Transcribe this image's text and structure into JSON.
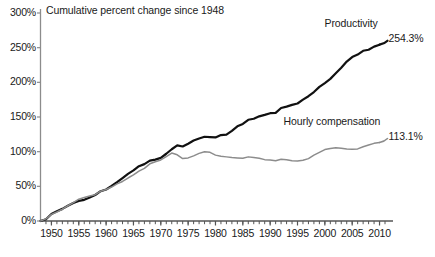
{
  "chart_data": {
    "type": "line",
    "title": "Cumulative percent change since 1948",
    "xlabel": "",
    "ylabel": "",
    "ylim": [
      0,
      300
    ],
    "xlim": [
      1948,
      2011
    ],
    "grid": false,
    "legend_position": "inline-right",
    "y_ticks": [
      "0%",
      "50%",
      "100%",
      "150%",
      "200%",
      "250%",
      "300%"
    ],
    "y_tick_values": [
      0,
      50,
      100,
      150,
      200,
      250,
      300
    ],
    "x_ticks": [
      "1950",
      "1955",
      "1960",
      "1965",
      "1970",
      "1975",
      "1980",
      "1985",
      "1990",
      "1995",
      "2000",
      "2005",
      "2010"
    ],
    "x_tick_values": [
      1950,
      1955,
      1960,
      1965,
      1970,
      1975,
      1980,
      1985,
      1990,
      1995,
      2000,
      2005,
      2010
    ],
    "x_minor_step": 1,
    "series": [
      {
        "name": "Productivity",
        "end_label": "254.3%",
        "color": "#111111",
        "width": 2.2,
        "x": [
          1948,
          1949,
          1950,
          1951,
          1952,
          1953,
          1954,
          1955,
          1956,
          1957,
          1958,
          1959,
          1960,
          1961,
          1962,
          1963,
          1964,
          1965,
          1966,
          1967,
          1968,
          1969,
          1970,
          1971,
          1972,
          1973,
          1974,
          1975,
          1976,
          1977,
          1978,
          1979,
          1980,
          1981,
          1982,
          1983,
          1984,
          1985,
          1986,
          1987,
          1988,
          1989,
          1990,
          1991,
          1992,
          1993,
          1994,
          1995,
          1996,
          1997,
          1998,
          1999,
          2000,
          2001,
          2002,
          2003,
          2004,
          2005,
          2006,
          2007,
          2008,
          2009,
          2010
        ],
        "values": [
          0,
          2.5,
          10,
          14,
          17.5,
          22,
          26,
          29,
          30.5,
          34,
          37.5,
          43,
          45.5,
          50.5,
          56,
          62,
          68,
          73,
          79,
          82,
          87,
          88.5,
          91,
          97,
          103.5,
          109,
          107.5,
          111.5,
          116,
          119,
          121.5,
          121,
          120.5,
          124,
          124.5,
          130,
          136.5,
          140,
          146,
          147.5,
          151,
          153,
          155.5,
          156,
          163,
          165,
          167.5,
          169.5,
          175,
          180,
          186,
          193.5,
          199,
          205,
          213,
          221,
          230,
          236.5,
          240,
          245.5,
          247,
          251.5,
          254.3
        ]
      },
      {
        "name": "Hourly compensation",
        "end_label": "113.1%",
        "color": "#8c8c8c",
        "width": 1.5,
        "x": [
          1948,
          1949,
          1950,
          1951,
          1952,
          1953,
          1954,
          1955,
          1956,
          1957,
          1958,
          1959,
          1960,
          1961,
          1962,
          1963,
          1964,
          1965,
          1966,
          1967,
          1968,
          1969,
          1970,
          1971,
          1972,
          1973,
          1974,
          1975,
          1976,
          1977,
          1978,
          1979,
          1980,
          1981,
          1982,
          1983,
          1984,
          1985,
          1986,
          1987,
          1988,
          1989,
          1990,
          1991,
          1992,
          1993,
          1994,
          1995,
          1996,
          1997,
          1998,
          1999,
          2000,
          2001,
          2002,
          2003,
          2004,
          2005,
          2006,
          2007,
          2008,
          2009,
          2010
        ],
        "values": [
          0,
          3,
          9.5,
          13,
          17,
          22,
          26.5,
          31.5,
          34,
          36,
          38,
          43,
          45.5,
          49,
          53.5,
          57,
          62,
          66.5,
          72,
          76,
          82.5,
          85.5,
          88,
          93,
          98,
          95.5,
          90,
          91,
          94,
          97.5,
          100,
          99,
          95,
          93.5,
          92.5,
          91.5,
          91,
          90.5,
          92.5,
          91.5,
          90.5,
          88.5,
          88,
          87,
          89,
          88.5,
          87,
          86.5,
          87.5,
          90,
          95,
          99,
          103,
          104.5,
          105.5,
          105,
          104,
          103.5,
          104,
          107,
          109.5,
          112,
          113.1
        ]
      }
    ]
  },
  "axis": {
    "axis_color": "#8c8c8c",
    "tick_color": "#555555"
  }
}
